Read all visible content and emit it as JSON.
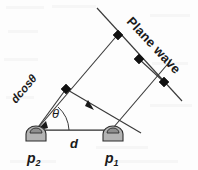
{
  "figure": {
    "labels": {
      "plane_wave": "Plane wave",
      "path_difference": "dcosθ",
      "angle": "θ",
      "spacing": "d",
      "sensor_2_name": "p",
      "sensor_2_index": "2",
      "sensor_1_name": "p",
      "sensor_1_index": "1"
    },
    "colors": {
      "background": "#fdfdfd",
      "line": "#3a3a3a",
      "marker": "#111111",
      "sensor_fill": "#b3b3b3",
      "sensor_cap": "#8f8f8f",
      "text": "#1a1a1a"
    },
    "geometry": {
      "sensor_2": {
        "x": 36,
        "y": 133
      },
      "sensor_1": {
        "x": 113,
        "y": 133
      },
      "baseline": {
        "x1": 36,
        "y1": 130,
        "x2": 113,
        "y2": 130
      },
      "wavefront_long": {
        "x1": 97,
        "y1": 8,
        "x2": 182,
        "y2": 101
      },
      "ray_upper": {
        "x1": 36,
        "y1": 130,
        "x2": 118,
        "y2": 30
      },
      "ray_middle": {
        "x1": 66,
        "y1": 89,
        "x2": 140,
        "y2": 133
      },
      "ray_lower": {
        "x1": 113,
        "y1": 130,
        "x2": 171,
        "y2": 60
      },
      "diamonds": [
        {
          "x": 66,
          "y": 89
        },
        {
          "x": 118,
          "y": 35
        },
        {
          "x": 139,
          "y": 59
        },
        {
          "x": 164,
          "y": 82
        }
      ],
      "angle_arc": {
        "cx": 36,
        "cy": 130,
        "radius": 30,
        "start_deg": 0,
        "end_deg": 50
      },
      "plane_wave_label_rotation_deg": 47,
      "dcos_label_rotation_deg": -50
    }
  }
}
